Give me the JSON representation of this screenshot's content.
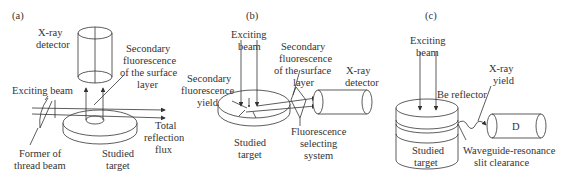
{
  "panels": {
    "a": {
      "tag": "(a)",
      "labels": {
        "detector_1": "X-ray",
        "detector_2": "detector",
        "sec_fl_1": "Secondary",
        "sec_fl_2": "fluorescence",
        "sec_fl_3": "of the surface",
        "sec_fl_4": "layer",
        "exciting": "Exciting beam",
        "total_1": "Total",
        "total_2": "reflection",
        "total_3": "flux",
        "former_1": "Former of",
        "former_2": "thread beam",
        "target_1": "Studied",
        "target_2": "target"
      }
    },
    "b": {
      "tag": "(b)",
      "labels": {
        "exciting_1": "Exciting",
        "exciting_2": "beam",
        "sec_fl_1": "Secondary",
        "sec_fl_2": "fluorescence",
        "sec_fl_3": "of the surface",
        "sec_fl_4": "layer",
        "detector_1": "X-ray",
        "detector_2": "detector",
        "yield_1": "Secondary",
        "yield_2": "fluorescence",
        "yield_3": "yield",
        "target_1": "Studied",
        "target_2": "target",
        "select_1": "Fluorescence",
        "select_2": "selecting",
        "select_3": "system"
      }
    },
    "c": {
      "tag": "(c)",
      "labels": {
        "exciting_1": "Exciting",
        "exciting_2": "beam",
        "xray_1": "X-ray",
        "xray_2": "yield",
        "reflector": "Be reflector",
        "detector": "D",
        "target_1": "Studied",
        "target_2": "target",
        "wave_1": "Waveguide-resonance",
        "wave_2": "slit clearance"
      }
    }
  }
}
